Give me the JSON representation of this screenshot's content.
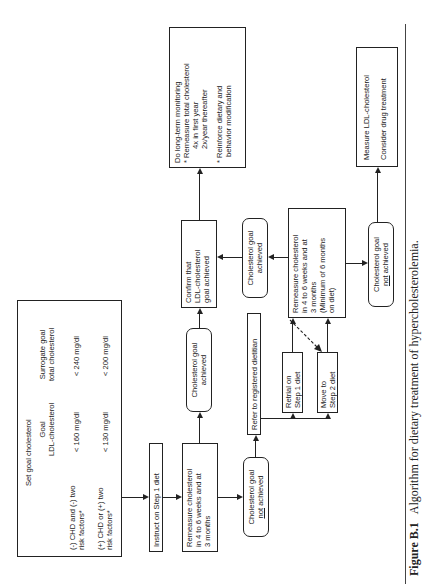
{
  "figure": {
    "label": "Figure B.1",
    "caption": "Algorithm for dietary treatment of hypercholesterolemia."
  },
  "set_goal": {
    "title": "Set goal cholesterol",
    "col_ldl": [
      "Goal",
      "LDL-cholesterol"
    ],
    "col_total": [
      "Surrogate goal",
      "total cholesterol"
    ],
    "rows": [
      {
        "condition": [
          "(-) CHD and (-) two",
          "risk factors*"
        ],
        "ldl": "< 160 mg/dl",
        "total": "< 240 mg/dl"
      },
      {
        "condition": [
          "(+) CHD or (+) two",
          "risk factors*"
        ],
        "ldl": "< 130 mg/dl",
        "total": "< 200 mg/dl"
      }
    ]
  },
  "instruct": {
    "label": "Instruct on Step 1 diet"
  },
  "remeasure1": {
    "lines": [
      "Remeasure cholesterol",
      "in 4 to 6 weeks and at",
      "3 months"
    ]
  },
  "goal_achieved_1": {
    "lines": [
      "Cholesterol goal",
      "achieved"
    ]
  },
  "not_achieved_1": {
    "line1": "Cholesterol goal",
    "not": "not",
    "rest": " achieved"
  },
  "confirm": {
    "lines": [
      "Confirm that",
      "LDL-cholesterol",
      "goal achieved"
    ]
  },
  "long_term": {
    "title": "Do long-term monitoring",
    "bullet1": "Remeasure total cholesterol",
    "sub1": "4x in first year",
    "sub2": "2x/year thereafter",
    "bullet2a": "Reinforce dietary and",
    "bullet2b": "behavior modification",
    "bullet_char": "*"
  },
  "refer": {
    "label": "Refer to registered dietitian"
  },
  "retrial": {
    "lines": [
      "Retrial on",
      "Step 1 diet"
    ]
  },
  "move_to": {
    "lines": [
      "Move to",
      "Step 2 diet"
    ]
  },
  "remeasure2": {
    "lines": [
      "Remeasure cholesterol",
      "in 4 to 6 weeks and at",
      "3 months",
      "(Minimum of 6 months",
      "on diet)"
    ]
  },
  "goal_achieved_2": {
    "lines": [
      "Cholesterol goal",
      "achieved"
    ]
  },
  "not_achieved_2": {
    "line1": "Cholesterol goal",
    "not": "not",
    "rest": " achieved"
  },
  "measure_ldl": {
    "line1": "Measure LDL-cholesterol",
    "line2": "Consider drug treatment"
  }
}
